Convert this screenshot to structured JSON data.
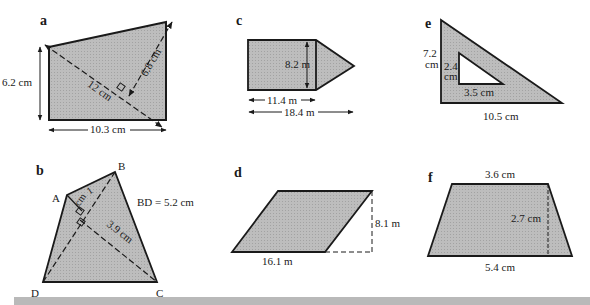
{
  "figures": {
    "a": {
      "label": "a",
      "left_height": "6.2 cm",
      "diagonal": "12 cm",
      "perpendicular": "6.8 cm",
      "base": "10.3 cm"
    },
    "b": {
      "label": "b",
      "vertex_a": "A",
      "vertex_b": "B",
      "vertex_c": "C",
      "vertex_d": "D",
      "perp_from_a_num": "1",
      "perp_from_a_unit": "cm",
      "perp_from_c": "3.9 cm",
      "bd_note": "BD = 5.2 cm"
    },
    "c": {
      "label": "c",
      "height": "8.2 m",
      "rect_width": "11.4 m",
      "total_width": "18.4 m"
    },
    "d": {
      "label": "d",
      "base": "16.1 m",
      "height": "8.1 m"
    },
    "e": {
      "label": "e",
      "outer_height_num": "7.2",
      "outer_height_unit": "cm",
      "inner_height_num": "2.4",
      "inner_height_unit": "cm",
      "inner_base": "3.5 cm",
      "outer_base": "10.5 cm"
    },
    "f": {
      "label": "f",
      "top": "3.6 cm",
      "height": "2.7 cm",
      "bottom": "5.4 cm"
    }
  },
  "colors": {
    "fill": "#b4b4b4",
    "stroke": "#1a1a1a",
    "band": "#b9b9b9"
  }
}
